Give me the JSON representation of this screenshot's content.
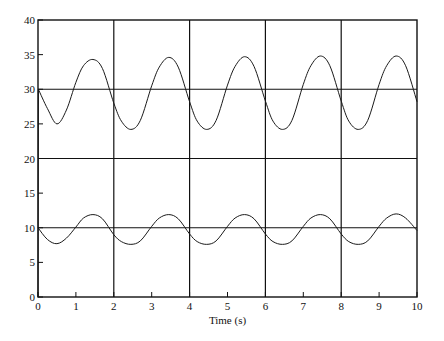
{
  "chart_data": {
    "type": "line",
    "title": "",
    "xlabel": "Time (s)",
    "ylabel": "",
    "xlim": [
      0,
      10
    ],
    "ylim": [
      0,
      40
    ],
    "x_ticks": [
      0,
      1,
      2,
      3,
      4,
      5,
      6,
      7,
      8,
      9,
      10
    ],
    "y_ticks": [
      0,
      5,
      10,
      15,
      20,
      25,
      30,
      35,
      40
    ],
    "grid": {
      "vertical": [
        2,
        4,
        6,
        8
      ],
      "horizontal": [
        10,
        20,
        30
      ]
    },
    "legend": null,
    "series": [
      {
        "name": "upper response",
        "description": "Oscillation about 30 with ~2 s period, initial spike from 0 to 30 at t=0",
        "x": [
          0,
          0.01,
          0.25,
          0.5,
          0.75,
          1.0,
          1.2,
          1.45,
          1.7,
          2.0,
          2.2,
          2.45,
          2.7,
          3.0,
          3.2,
          3.45,
          3.7,
          4.0,
          4.2,
          4.45,
          4.7,
          5.0,
          5.2,
          5.45,
          5.7,
          6.0,
          6.2,
          6.45,
          6.7,
          7.0,
          7.2,
          7.45,
          7.7,
          8.0,
          8.2,
          8.45,
          8.7,
          9.0,
          9.2,
          9.45,
          9.7,
          10.0
        ],
        "values": [
          0,
          30,
          27.2,
          25.0,
          27.0,
          31.0,
          33.4,
          34.3,
          33.0,
          28.0,
          25.4,
          24.2,
          25.5,
          30.5,
          33.2,
          34.6,
          33.2,
          28.2,
          25.4,
          24.2,
          25.5,
          30.6,
          33.3,
          34.7,
          33.3,
          28.3,
          25.4,
          24.2,
          25.5,
          30.7,
          33.4,
          34.8,
          33.4,
          28.3,
          25.4,
          24.2,
          25.5,
          30.7,
          33.4,
          34.8,
          33.4,
          28.2
        ]
      },
      {
        "name": "lower response",
        "description": "Oscillation about 10 with ~2 s period",
        "x": [
          0,
          0.25,
          0.5,
          0.75,
          1.0,
          1.2,
          1.45,
          1.7,
          2.0,
          2.2,
          2.45,
          2.7,
          3.0,
          3.2,
          3.45,
          3.7,
          4.0,
          4.2,
          4.45,
          4.7,
          5.0,
          5.2,
          5.45,
          5.7,
          6.0,
          6.2,
          6.45,
          6.7,
          7.0,
          7.2,
          7.45,
          7.7,
          8.0,
          8.2,
          8.45,
          8.7,
          9.0,
          9.2,
          9.45,
          9.7,
          10.0
        ],
        "values": [
          10,
          8.3,
          7.7,
          8.5,
          10.1,
          11.4,
          11.9,
          11.3,
          9.0,
          8.0,
          7.6,
          8.1,
          10.2,
          11.4,
          11.9,
          11.3,
          9.1,
          8.0,
          7.6,
          8.1,
          10.2,
          11.4,
          11.9,
          11.3,
          9.1,
          8.0,
          7.6,
          8.1,
          10.2,
          11.4,
          11.9,
          11.3,
          9.1,
          8.0,
          7.6,
          8.1,
          10.2,
          11.4,
          12.0,
          11.4,
          9.6
        ]
      }
    ]
  },
  "colors": {
    "line": "#1a1a1a",
    "grid": "#111111",
    "background": "#ffffff"
  },
  "plot_area": {
    "left": 38,
    "top": 20,
    "right": 417,
    "bottom": 297
  }
}
